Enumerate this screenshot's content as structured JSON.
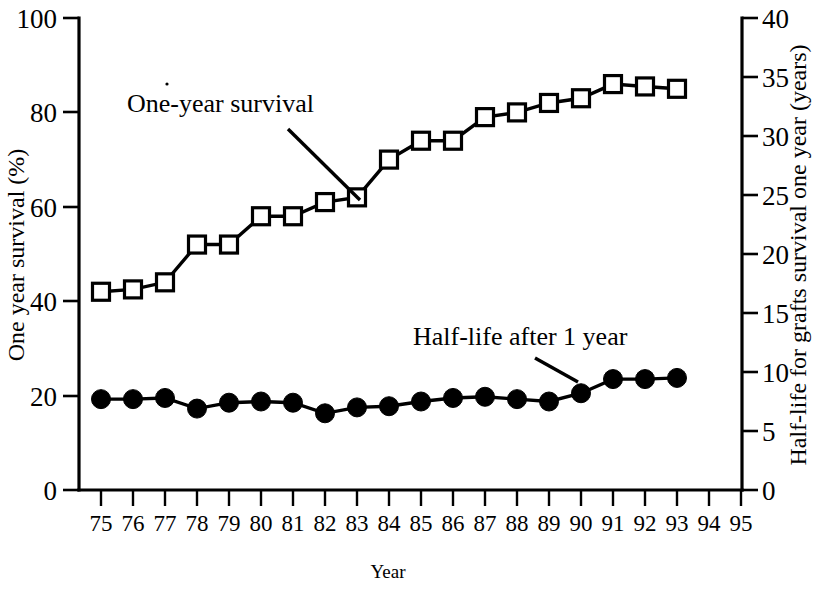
{
  "chart_data": {
    "type": "line",
    "title": "",
    "xlabel": "Year",
    "ylabel": "One year survival (%)",
    "y2label": "Half-life for grafts survival one year (years)",
    "x": [
      75,
      76,
      77,
      78,
      79,
      80,
      81,
      82,
      83,
      84,
      85,
      86,
      87,
      88,
      89,
      90,
      91,
      92,
      93,
      94,
      95
    ],
    "xtick_labels": [
      "75",
      "76",
      "77",
      "78",
      "79",
      "80",
      "81",
      "82",
      "83",
      "84",
      "85",
      "86",
      "87",
      "88",
      "89",
      "90",
      "91",
      "92",
      "93",
      "94",
      "95"
    ],
    "xlim": [
      74.3,
      95.7
    ],
    "ylim": [
      0,
      100
    ],
    "ytick_labels": [
      "0",
      "20",
      "40",
      "60",
      "80",
      "100"
    ],
    "yticks": [
      0,
      20,
      40,
      60,
      80,
      100
    ],
    "y2lim": [
      0,
      40
    ],
    "y2tick_labels": [
      "0",
      "5",
      "10",
      "15",
      "20",
      "25",
      "30",
      "35",
      "40"
    ],
    "y2ticks": [
      0,
      5,
      10,
      15,
      20,
      25,
      30,
      35,
      40
    ],
    "grid": false,
    "legend_position": "inline-annotations",
    "series": [
      {
        "name": "One-year survival",
        "axis": "left",
        "marker": "open-square",
        "color": "#000000",
        "x": [
          75,
          76,
          77,
          78,
          79,
          80,
          81,
          82,
          83,
          84,
          85,
          86,
          87,
          88,
          89,
          90,
          91,
          92,
          93
        ],
        "values": [
          42,
          42.5,
          44,
          52,
          52,
          58,
          58,
          61,
          62,
          70,
          74,
          74,
          79,
          80,
          82,
          83,
          86,
          85.5,
          85
        ]
      },
      {
        "name": "Half-life after 1 year",
        "axis": "right",
        "marker": "filled-circle",
        "color": "#000000",
        "x": [
          75,
          76,
          77,
          78,
          79,
          80,
          81,
          82,
          83,
          84,
          85,
          86,
          87,
          88,
          89,
          90,
          91,
          92,
          93
        ],
        "values_left_scale": [
          19.2,
          19.2,
          19.6,
          17.2,
          18.6,
          18.8,
          18.4,
          16.2,
          17.4,
          17.8,
          18.8,
          19.4,
          19.8,
          19.2,
          18.8,
          20.6,
          23.4,
          23.4,
          23.8
        ],
        "values": [
          7.7,
          7.7,
          7.8,
          6.9,
          7.4,
          7.5,
          7.4,
          6.5,
          7.0,
          7.1,
          7.5,
          7.8,
          7.9,
          7.7,
          7.5,
          8.2,
          9.4,
          9.4,
          9.5
        ]
      }
    ],
    "annotations": [
      {
        "text": "One-year survival",
        "target_series": "One-year survival"
      },
      {
        "text": "Half-life after 1 year",
        "target_series": "Half-life after 1 year"
      }
    ]
  }
}
